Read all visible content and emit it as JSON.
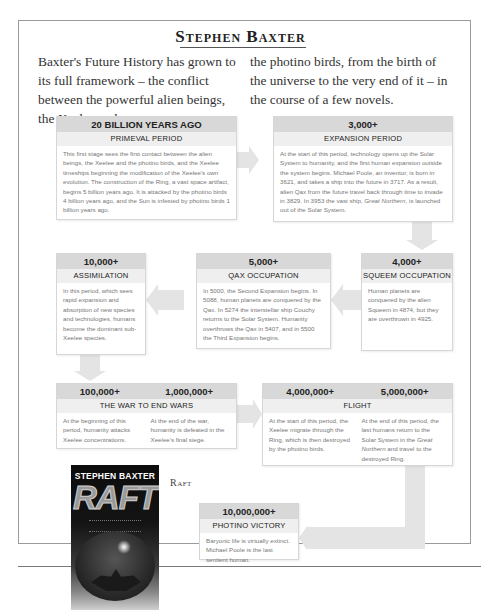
{
  "page": {
    "title": "Stephen Baxter",
    "intro_left": "Baxter's Future History has grown to its full framework – the conflict between the powerful alien beings, the Xeelee and",
    "intro_right": "the photino birds, from the birth of the universe to the very end of it – in the course of a few novels."
  },
  "timeline": [
    {
      "id": "primeval",
      "date": "20 BILLION YEARS AGO",
      "period": "PRIMEVAL PERIOD",
      "body": "This first stage sees the first contact between the alien beings, the Xeelee and the photino birds, and the Xeelee timeships beginning the modification of the Xeelee's own evolution. The construction of the Ring, a vast space artifact, begins 5 billion years ago. It is attacked by the photino birds 4 billion years ago, and the Sun is infested by photino birds 1 billion years ago."
    },
    {
      "id": "expansion",
      "date": "3,000+",
      "period": "EXPANSION PERIOD",
      "body_pre": "At the start of this period, technology opens up the Solar System to humanity, and the first human expansion outside the system begins. Michael Poole, an inventor, is born in 3621, and takes a ship into the future in 3717. As a result, alien Qax from the future travel back through time to invade in 3829. In 3953 the vast ship, ",
      "body_em": "Great Northern",
      "body_post": ", is launched out of the Solar System."
    },
    {
      "id": "squeem",
      "date": "4,000+",
      "period": "SQUEEM OCCUPATION",
      "body": "Human planets are conquered by the alien Squeem in 4874, but they are overthrown in 4925."
    },
    {
      "id": "qax",
      "date": "5,000+",
      "period": "QAX OCCUPATION",
      "body": "In 5000, the Second Expansion begins. In 5088, human planets are conquered by the Qax. In 5274 the interstellar ship Couchy returns to the Solar System. Humanity overthrows the Qax in 5407, and in 5500 the Third Expansion begins."
    },
    {
      "id": "assimilation",
      "date": "10,000+",
      "period": "ASSIMILATION",
      "body": "In this period, which sees rapid expansion and absorption of new species and technologies, humans become the dominant sub-Xeelee species."
    },
    {
      "id": "war",
      "dates": [
        "100,000+",
        "1,000,000+"
      ],
      "period": "THE WAR TO END WARS",
      "cols": [
        "At the beginning of this period, humanity attacks Xeelee concentrations.",
        "At the end of the war, humanity is defeated in the Xeelee's final siege."
      ]
    },
    {
      "id": "flight",
      "dates": [
        "4,000,000+",
        "5,000,000+"
      ],
      "period": "FLIGHT",
      "col1": "At the start of this period, the Xeelee migrate through the Ring, which is then destroyed by the photino birds.",
      "col2_pre": "At the end of this period, the last humans return to the Solar System in the ",
      "col2_em": "Great Northern",
      "col2_post": " and travel to the destroyed Ring."
    },
    {
      "id": "photino",
      "date": "10,000,000+",
      "period": "PHOTINO VICTORY",
      "body": "Baryonic life is virtually extinct. Michael Poole is the last sentient human."
    }
  ],
  "book": {
    "author": "STEPHEN BAXTER",
    "title": "RAFT",
    "caption": "Raft"
  },
  "colors": {
    "date_bar": "#d8d8d8",
    "period_bar": "#efefef",
    "arrow": "#e4e4e4",
    "body_text": "#777777"
  }
}
